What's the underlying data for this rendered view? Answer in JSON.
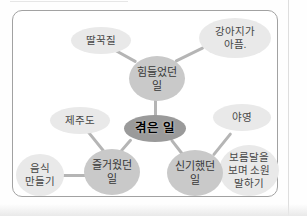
{
  "diagram": {
    "type": "mind-map",
    "nodes": {
      "experienced": {
        "label": "겪은 일"
      },
      "hard": {
        "line1": "힘들었던",
        "line2": "일"
      },
      "fun": {
        "line1": "즐거웠던",
        "line2": "일"
      },
      "amazing": {
        "line1": "신기했던",
        "line2": "일"
      },
      "hiccup": {
        "label": "딸꾹질"
      },
      "puppy": {
        "line1": "강아지가",
        "line2": "아픔."
      },
      "jeju": {
        "label": "제주도"
      },
      "cooking": {
        "line1": "음식",
        "line2": "만들기"
      },
      "camping": {
        "label": "야영"
      },
      "fullmoon": {
        "line1": "보름달을",
        "line2": "보며 소원",
        "line3": "말하기"
      }
    },
    "colors": {
      "center_node_fill": "#9a9a9a",
      "branch_node_fill": "#c9c9c9",
      "leaf_node_fill": "#e9e9e9",
      "connector": "#b5b5b5",
      "frame_border": "#a2a2a2",
      "text": "#383838"
    }
  }
}
